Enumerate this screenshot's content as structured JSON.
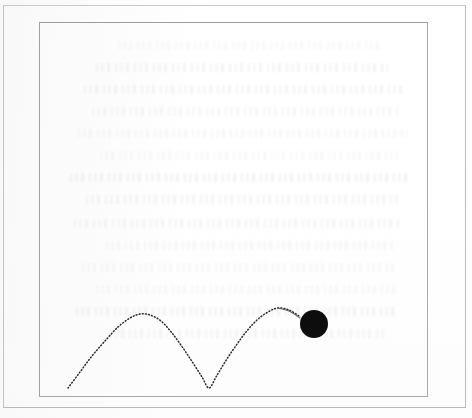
{
  "figure": {
    "title": "",
    "caption": "",
    "background_color": "#fefefe",
    "outer_frame_color": "#b9b9bb",
    "inner_frame_color": "#a9a9ac"
  },
  "chart_data": {
    "type": "line",
    "title": "",
    "subtitle": "",
    "xlabel": "",
    "ylabel": "",
    "xlim": [
      39,
      428
    ],
    "ylim": [
      397,
      22
    ],
    "grid": false,
    "legend_position": "none",
    "series": [
      {
        "name": "bounce-trajectory",
        "style": "dotted",
        "color": "#2b2b2b",
        "points": [
          [
            68,
            388
          ],
          [
            80,
            372
          ],
          [
            92,
            356
          ],
          [
            105,
            341
          ],
          [
            118,
            327
          ],
          [
            130,
            318
          ],
          [
            140,
            314
          ],
          [
            150,
            315
          ],
          [
            161,
            321
          ],
          [
            172,
            333
          ],
          [
            183,
            348
          ],
          [
            193,
            363
          ],
          [
            202,
            377
          ],
          [
            209,
            388
          ],
          [
            216,
            377
          ],
          [
            225,
            362
          ],
          [
            235,
            347
          ],
          [
            246,
            332
          ],
          [
            257,
            320
          ],
          [
            268,
            312
          ],
          [
            278,
            308
          ],
          [
            289,
            310
          ],
          [
            299,
            316
          ]
        ]
      },
      {
        "name": "ball-tail",
        "style": "solid",
        "color": "#5c5c5c",
        "points": [
          [
            278,
            308
          ],
          [
            289,
            311
          ],
          [
            300,
            318
          ]
        ]
      }
    ],
    "markers": [
      {
        "name": "ball",
        "shape": "circle",
        "filled": true,
        "color": "#0d0d0d",
        "center_x": 314,
        "center_y": 324,
        "radius": 14
      }
    ],
    "annotations": [
      {
        "name": "first-arch-peak",
        "x": 140,
        "y": 314
      },
      {
        "name": "bounce-contact-point",
        "x": 209,
        "y": 388
      },
      {
        "name": "second-arch-peak",
        "x": 278,
        "y": 308
      }
    ]
  },
  "background_ghost_text": {
    "legible": false,
    "note": "",
    "line_count": 14,
    "lines": [
      {
        "top": 18,
        "left": 78,
        "width": 266
      },
      {
        "top": 40,
        "left": 56,
        "width": 292
      },
      {
        "top": 62,
        "left": 44,
        "width": 318
      },
      {
        "top": 84,
        "left": 52,
        "width": 306
      },
      {
        "top": 106,
        "left": 38,
        "width": 330
      },
      {
        "top": 128,
        "left": 60,
        "width": 298
      },
      {
        "top": 150,
        "left": 30,
        "width": 338
      },
      {
        "top": 172,
        "left": 46,
        "width": 312
      },
      {
        "top": 196,
        "left": 34,
        "width": 326
      },
      {
        "top": 218,
        "left": 66,
        "width": 288
      },
      {
        "top": 240,
        "left": 42,
        "width": 314
      },
      {
        "top": 262,
        "left": 56,
        "width": 300
      },
      {
        "top": 284,
        "left": 36,
        "width": 322
      },
      {
        "top": 306,
        "left": 70,
        "width": 274
      }
    ]
  }
}
